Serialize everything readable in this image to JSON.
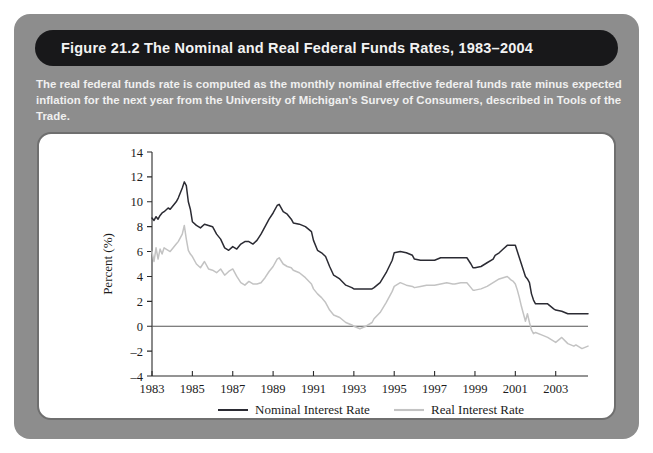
{
  "figure": {
    "title": "Figure 21.2    The Nominal and Real Federal Funds Rates, 1983–2004",
    "caption": "The real federal funds rate is computed as the monthly nominal effective federal funds rate minus expected inflation for the next year from the University of Michigan's Survey of Consumers, described in Tools of the Trade."
  },
  "colors": {
    "panel": "#8d8d8d",
    "title_bar": "#18181a",
    "card": "#ffffff",
    "card_border": "#6f6f6f",
    "nominal": "#2b2b33",
    "real": "#c3c3c3",
    "axis": "#2a2a2a"
  },
  "chart_data": {
    "type": "line",
    "title": "",
    "xlabel": "",
    "ylabel": "Percent (%)",
    "xlim": [
      1983,
      2004.6
    ],
    "ylim": [
      -4,
      14
    ],
    "ytick_labels": [
      "14",
      "12",
      "10",
      "8",
      "6",
      "4",
      "2",
      "0",
      "–2",
      "–4"
    ],
    "yticks": [
      14,
      12,
      10,
      8,
      6,
      4,
      2,
      0,
      -2,
      -4
    ],
    "xtick_labels": [
      "1983",
      "1985",
      "1987",
      "1989",
      "1991",
      "1993",
      "1995",
      "1997",
      "1999",
      "2001",
      "2003"
    ],
    "xticks": [
      1983,
      1985,
      1987,
      1989,
      1991,
      1993,
      1995,
      1997,
      1999,
      2001,
      2003
    ],
    "grid": false,
    "zero_line": true,
    "legend_position": "below",
    "x": [
      1983.0,
      1983.1,
      1983.2,
      1983.3,
      1983.4,
      1983.5,
      1983.6,
      1983.8,
      1983.9,
      1984.0,
      1984.2,
      1984.3,
      1984.5,
      1984.6,
      1984.7,
      1984.8,
      1984.9,
      1985.0,
      1985.2,
      1985.4,
      1985.6,
      1985.8,
      1986.0,
      1986.2,
      1986.4,
      1986.6,
      1986.8,
      1987.0,
      1987.2,
      1987.4,
      1987.6,
      1987.8,
      1988.0,
      1988.2,
      1988.4,
      1988.6,
      1988.8,
      1989.0,
      1989.2,
      1989.3,
      1989.5,
      1989.7,
      1989.9,
      1990.0,
      1990.3,
      1990.6,
      1990.9,
      1991.0,
      1991.2,
      1991.4,
      1991.6,
      1991.8,
      1992.0,
      1992.3,
      1992.6,
      1992.9,
      1993.0,
      1993.3,
      1993.6,
      1993.9,
      1994.0,
      1994.3,
      1994.6,
      1994.9,
      1995.0,
      1995.3,
      1995.6,
      1995.9,
      1996.0,
      1996.3,
      1996.6,
      1996.9,
      1997.0,
      1997.3,
      1997.6,
      1997.9,
      1998.0,
      1998.3,
      1998.6,
      1998.8,
      1998.9,
      1999.0,
      1999.3,
      1999.6,
      1999.9,
      2000.0,
      2000.2,
      2000.4,
      2000.6,
      2000.8,
      2000.9,
      2001.0,
      2001.1,
      2001.2,
      2001.3,
      2001.4,
      2001.5,
      2001.6,
      2001.7,
      2001.8,
      2001.9,
      2002.0,
      2002.3,
      2002.6,
      2002.9,
      2003.0,
      2003.3,
      2003.6,
      2003.9,
      2004.0,
      2004.3,
      2004.6
    ],
    "series": [
      {
        "name": "Nominal Interest Rate",
        "color": "#2b2b33",
        "values": [
          8.7,
          8.5,
          8.8,
          8.6,
          8.9,
          9.1,
          9.2,
          9.5,
          9.4,
          9.6,
          10.0,
          10.3,
          11.1,
          11.6,
          11.3,
          10.0,
          9.4,
          8.4,
          8.1,
          7.9,
          8.2,
          8.1,
          8.0,
          7.4,
          7.0,
          6.3,
          6.1,
          6.4,
          6.2,
          6.6,
          6.8,
          6.8,
          6.6,
          6.9,
          7.4,
          8.0,
          8.6,
          9.1,
          9.7,
          9.8,
          9.2,
          9.0,
          8.6,
          8.3,
          8.2,
          8.0,
          7.6,
          6.9,
          6.1,
          5.9,
          5.6,
          4.8,
          4.1,
          3.8,
          3.3,
          3.1,
          3.0,
          3.0,
          3.0,
          3.0,
          3.1,
          3.5,
          4.3,
          5.3,
          5.9,
          6.0,
          5.9,
          5.7,
          5.4,
          5.3,
          5.3,
          5.3,
          5.3,
          5.5,
          5.5,
          5.5,
          5.5,
          5.5,
          5.5,
          5.0,
          4.7,
          4.7,
          4.8,
          5.1,
          5.4,
          5.7,
          5.9,
          6.2,
          6.5,
          6.5,
          6.5,
          6.5,
          6.0,
          5.5,
          5.0,
          4.5,
          4.0,
          3.8,
          3.5,
          2.6,
          2.1,
          1.8,
          1.8,
          1.8,
          1.4,
          1.3,
          1.2,
          1.0,
          1.0,
          1.0,
          1.0,
          1.0
        ]
      },
      {
        "name": "Real Interest Rate",
        "color": "#c3c3c3",
        "values": [
          6.0,
          5.2,
          6.3,
          5.4,
          6.2,
          5.8,
          6.3,
          6.1,
          6.0,
          6.2,
          6.6,
          6.8,
          7.4,
          8.1,
          7.0,
          6.1,
          5.8,
          5.6,
          5.0,
          4.7,
          5.2,
          4.6,
          4.5,
          4.3,
          4.6,
          4.1,
          4.4,
          4.6,
          4.0,
          3.5,
          3.3,
          3.6,
          3.4,
          3.4,
          3.5,
          3.9,
          4.4,
          4.8,
          5.4,
          5.5,
          5.0,
          4.8,
          4.7,
          4.5,
          4.3,
          3.9,
          3.4,
          3.0,
          2.6,
          2.3,
          1.9,
          1.3,
          0.9,
          0.7,
          0.3,
          0.1,
          0.0,
          -0.2,
          0.0,
          0.3,
          0.6,
          1.1,
          1.9,
          2.8,
          3.2,
          3.5,
          3.3,
          3.2,
          3.1,
          3.2,
          3.3,
          3.3,
          3.3,
          3.4,
          3.5,
          3.4,
          3.4,
          3.5,
          3.5,
          3.1,
          2.9,
          2.9,
          3.0,
          3.2,
          3.5,
          3.6,
          3.8,
          3.9,
          4.0,
          3.7,
          3.6,
          3.4,
          2.9,
          2.3,
          1.6,
          1.0,
          0.4,
          1.0,
          0.3,
          -0.3,
          -0.6,
          -0.5,
          -0.7,
          -0.9,
          -1.2,
          -1.3,
          -0.9,
          -1.4,
          -1.6,
          -1.5,
          -1.8,
          -1.6
        ]
      }
    ],
    "legend": [
      {
        "label": "Nominal Interest Rate",
        "color": "#2b2b33"
      },
      {
        "label": "Real Interest Rate",
        "color": "#c3c3c3"
      }
    ]
  }
}
